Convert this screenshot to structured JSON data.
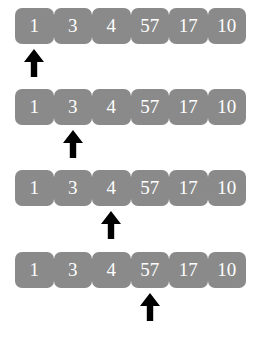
{
  "figure": {
    "background_color": "#ffffff",
    "cell_color": "#8a8a8a",
    "cell_text_color": "#ffffff",
    "arrow_color": "#000000",
    "array_values": [
      "1",
      "3",
      "4",
      "57",
      "17",
      "10"
    ],
    "arrow_icon_name": "up-arrow-icon",
    "steps": [
      {
        "step_number": "1",
        "pointer_index": 0,
        "pointer_value": "1",
        "cells": [
          "1",
          "3",
          "4",
          "57",
          "17",
          "10"
        ]
      },
      {
        "step_number": "2",
        "pointer_index": 1,
        "pointer_value": "3",
        "cells": [
          "1",
          "3",
          "4",
          "57",
          "17",
          "10"
        ]
      },
      {
        "step_number": "3",
        "pointer_index": 2,
        "pointer_value": "4",
        "cells": [
          "1",
          "3",
          "4",
          "57",
          "17",
          "10"
        ]
      },
      {
        "step_number": "4",
        "pointer_index": 3,
        "pointer_value": "57",
        "cells": [
          "1",
          "3",
          "4",
          "57",
          "17",
          "10"
        ]
      }
    ]
  }
}
